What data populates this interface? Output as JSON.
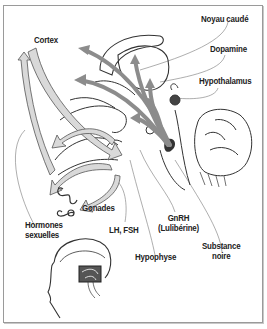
{
  "diagram": {
    "type": "anatomical-illustration",
    "colors": {
      "frame": "#9a9a9a",
      "arrow_fill": "#8c8c8c",
      "hollow_arrow_fill": "#d9d9d9",
      "line": "#333333",
      "leader": "#777777",
      "text": "#222222"
    },
    "labels": {
      "noyau_caude": "Noyau caudé",
      "cortex": "Cortex",
      "dopamine": "Dopamine",
      "hypothalamus": "Hypothalamus",
      "gonades": "Gonades",
      "hormones_line1": "Hormones",
      "hormones_line2": "sexuelles",
      "lh_fsh": "LH, FSH",
      "gnrh_line1": "GnRH",
      "gnrh_line2": "(Lulibérine)",
      "hypophyse": "Hypophyse",
      "substance_line1": "Substance",
      "substance_line2": "noire"
    }
  }
}
